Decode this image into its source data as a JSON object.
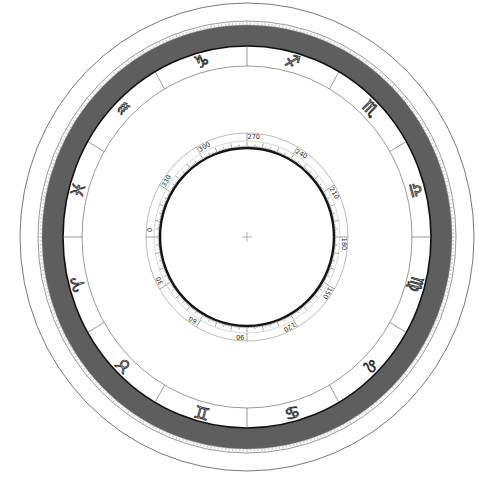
{
  "diagram": {
    "center": {
      "x": 247,
      "y": 237
    },
    "colors": {
      "band": "#5e5e5e",
      "line": "#222222",
      "thin_line": "#555555",
      "background": "#ffffff"
    },
    "rings": {
      "outer_thin": {
        "rx": 227,
        "ry": 234
      },
      "band_outer": {
        "rx": 205,
        "ry": 212
      },
      "band_inner": {
        "rx": 184,
        "ry": 191
      },
      "zodiac_inner": {
        "rx": 165,
        "ry": 171
      },
      "scale_outer": {
        "rx": 101,
        "ry": 104
      },
      "scale_label_inner": {
        "rx": 93,
        "ry": 96
      },
      "inner_thick": {
        "rx": 87,
        "ry": 89
      }
    },
    "zodiac_signs": [
      {
        "name": "Capricorn",
        "symbol": "♑",
        "angle_deg": 255
      },
      {
        "name": "Sagittarius",
        "symbol": "♐",
        "angle_deg": 285
      },
      {
        "name": "Scorpio",
        "symbol": "♏",
        "angle_deg": 315
      },
      {
        "name": "Libra",
        "symbol": "♎",
        "angle_deg": 345
      },
      {
        "name": "Virgo",
        "symbol": "♍",
        "angle_deg": 15
      },
      {
        "name": "Leo",
        "symbol": "♌",
        "angle_deg": 45
      },
      {
        "name": "Cancer",
        "symbol": "♋",
        "angle_deg": 75
      },
      {
        "name": "Gemini",
        "symbol": "♊",
        "angle_deg": 105
      },
      {
        "name": "Taurus",
        "symbol": "♉",
        "angle_deg": 135
      },
      {
        "name": "Aries",
        "symbol": "♈",
        "angle_deg": 165
      },
      {
        "name": "Pisces",
        "symbol": "♓",
        "angle_deg": 195
      },
      {
        "name": "Aquarius",
        "symbol": "♒",
        "angle_deg": 225
      }
    ],
    "zodiac_dividers_deg": [
      0,
      30,
      60,
      90,
      120,
      150,
      180,
      210,
      240,
      270,
      300,
      330
    ],
    "degree_scale_labels": [
      {
        "label": "0",
        "angle_deg": 180
      },
      {
        "label": "30",
        "angle_deg": 150
      },
      {
        "label": "60",
        "angle_deg": 120
      },
      {
        "label": "90",
        "angle_deg": 90
      },
      {
        "label": "120",
        "angle_deg": 60
      },
      {
        "label": "150",
        "angle_deg": 30
      },
      {
        "label": "180",
        "angle_deg": 0
      },
      {
        "label": "210",
        "angle_deg": 330
      },
      {
        "label": "240",
        "angle_deg": 300
      },
      {
        "label": "270",
        "angle_deg": 270
      },
      {
        "label": "300",
        "angle_deg": 240
      },
      {
        "label": "330",
        "angle_deg": 210
      }
    ],
    "outer_tick_count": 360,
    "inner_tick_count": 360,
    "center_mark": "crosshair"
  }
}
